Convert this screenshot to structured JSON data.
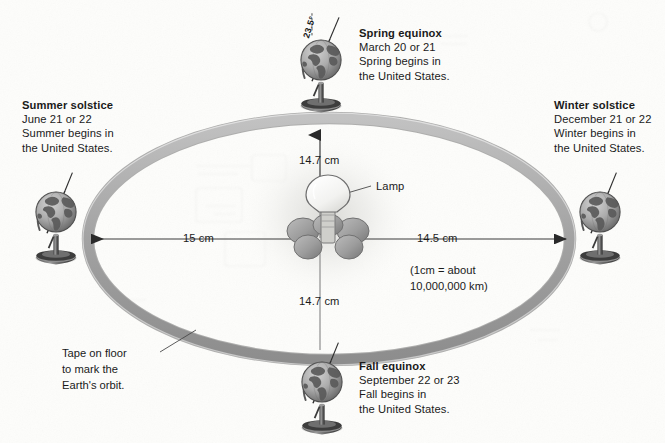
{
  "diagram": {
    "orbit_note": {
      "lines": [
        "Tape on floor",
        "to mark the",
        "Earth's orbit."
      ]
    },
    "lamp_label": "Lamp",
    "scale_note": {
      "line1": "(1cm = about",
      "line2": "10,000,000 km)"
    },
    "measurements": {
      "left": "15 cm",
      "right": "14.5 cm",
      "top": "14.7 cm",
      "bottom": "14.7 cm"
    },
    "tilt_angle": "23.5°",
    "positions": [
      {
        "id": "spring-equinox",
        "heading": "Spring equinox",
        "date": "March 20 or 21",
        "line3": "Spring begins in",
        "line4": "the United States."
      },
      {
        "id": "summer-solstice",
        "heading": "Summer solstice",
        "date": "June 21 or 22",
        "line3": "Summer begins in",
        "line4": "the United States."
      },
      {
        "id": "winter-solstice",
        "heading": "Winter solstice",
        "date": "December 21 or 22",
        "line3": "Winter begins in",
        "line4": "the United States."
      },
      {
        "id": "fall-equinox",
        "heading": "Fall equinox",
        "date": "September 22 or 23",
        "line3": "Fall begins in",
        "line4": "the United States."
      }
    ],
    "colors": {
      "background": "#fdfdfb",
      "orbit_band": "#a9a9a9",
      "orbit_edge": "#767676",
      "globe_ocean": "#b4b4b4",
      "globe_land": "#5d5d5d",
      "text": "#1a1a1a",
      "lamp_glow": "#e8e8e6",
      "measure_line": "#3a3a3a"
    }
  }
}
